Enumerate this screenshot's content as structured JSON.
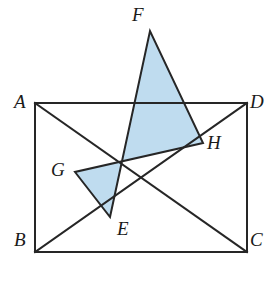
{
  "figure": {
    "type": "geometry-diagram",
    "canvas": {
      "width": 277,
      "height": 288,
      "background": "#ffffff"
    },
    "colors": {
      "stroke": "#262626",
      "shaded_fill": "#bfdcef",
      "shaded_stroke": "#262626",
      "label_color": "#1a1a1a"
    },
    "stroke_width": 2,
    "points": {
      "A": {
        "x": 35,
        "y": 103,
        "label": "A",
        "label_x": 14,
        "label_y": 92
      },
      "B": {
        "x": 35,
        "y": 252,
        "label": "B",
        "label_x": 14,
        "label_y": 230
      },
      "C": {
        "x": 247,
        "y": 252,
        "label": "C",
        "label_x": 250,
        "label_y": 230
      },
      "D": {
        "x": 247,
        "y": 103,
        "label": "D",
        "label_x": 250,
        "label_y": 92
      },
      "E": {
        "x": 110,
        "y": 217,
        "label": "E",
        "label_x": 117,
        "label_y": 219
      },
      "F": {
        "x": 150,
        "y": 31,
        "label": "F",
        "label_x": 132,
        "label_y": 5
      },
      "G": {
        "x": 75,
        "y": 172,
        "label": "G",
        "label_x": 51,
        "label_y": 160
      },
      "H": {
        "x": 203,
        "y": 143,
        "label": "H",
        "label_x": 207,
        "label_y": 133
      }
    },
    "rectangle": {
      "name": "rectangle-ABCD",
      "vertices": [
        "A",
        "B",
        "C",
        "D"
      ],
      "path": "M 35 103 L 247 103 L 247 252 L 35 252 Z"
    },
    "diagonals": [
      {
        "name": "diagonal-AC",
        "from": "A",
        "to": "C",
        "path": "M 35 103 L 247 252"
      },
      {
        "name": "diagonal-BD",
        "from": "B",
        "to": "D",
        "path": "M 35 252 L 247 103"
      }
    ],
    "shaded_quad": {
      "name": "rhombus-EFGH",
      "vertices": [
        "E",
        "F",
        "H",
        "G"
      ],
      "path": "M 110 217 L 150 31 L 203 143 L 75 172 Z"
    },
    "labels": [
      "A",
      "B",
      "C",
      "D",
      "E",
      "F",
      "G",
      "H"
    ]
  }
}
